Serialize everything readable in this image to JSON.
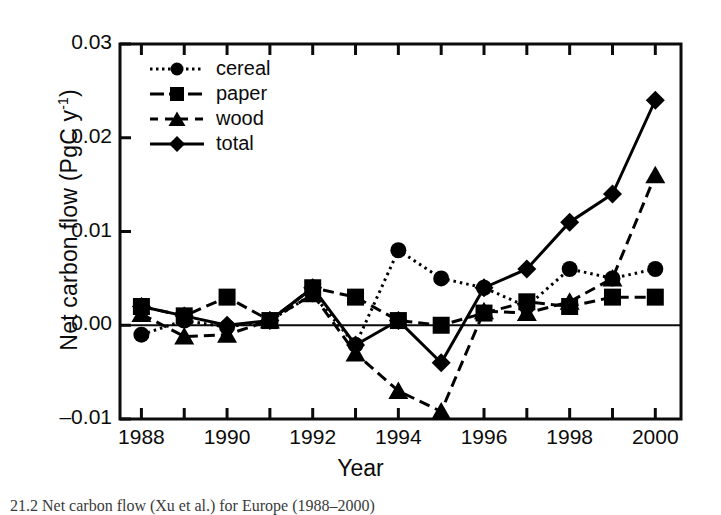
{
  "chart_data": {
    "type": "line",
    "title": "",
    "xlabel": "Year",
    "ylabel": "Net carbon flow (PgC y-1)",
    "ylabel_main": "Net carbon flow (PgC y",
    "ylabel_sup": "-1",
    "ylabel_tail": ")",
    "x": [
      1988,
      1989,
      1990,
      1991,
      1992,
      1993,
      1994,
      1995,
      1996,
      1997,
      1998,
      1999,
      2000
    ],
    "xlim": [
      1987.5,
      2000.6
    ],
    "ylim": [
      -0.01,
      0.03
    ],
    "grid": false,
    "legend_position": "upper-left-inside",
    "yticks": [
      -0.01,
      0.0,
      0.01,
      0.02,
      0.03
    ],
    "ytick_labels": [
      "–0.01",
      "0.00",
      "0.01",
      "0.02",
      "0.03"
    ],
    "xticks": [
      1988,
      1989,
      1990,
      1991,
      1992,
      1993,
      1994,
      1995,
      1996,
      1997,
      1998,
      1999,
      2000
    ],
    "xtick_labels_shown": [
      "1988",
      "1990",
      "1992",
      "1994",
      "1996",
      "1998",
      "2000"
    ],
    "xtick_labels_years": [
      1988,
      1990,
      1992,
      1994,
      1996,
      1998,
      2000
    ],
    "zero_line": 0.0,
    "series": [
      {
        "name": "cereal",
        "marker": "circle",
        "linestyle": "dotted",
        "color": "#000000",
        "values": [
          -0.001,
          0.0005,
          -0.0002,
          0.0005,
          0.0033,
          -0.0021,
          0.008,
          0.005,
          0.004,
          0.002,
          0.006,
          0.005,
          0.006
        ]
      },
      {
        "name": "paper",
        "marker": "square",
        "linestyle": "dashed",
        "color": "#000000",
        "values": [
          0.002,
          0.001,
          0.003,
          0.0005,
          0.004,
          0.003,
          0.0005,
          0.0,
          0.0013,
          0.0025,
          0.002,
          0.003,
          0.003
        ]
      },
      {
        "name": "wood",
        "marker": "triangle",
        "linestyle": "dashed",
        "color": "#000000",
        "values": [
          0.0012,
          -0.0012,
          -0.001,
          0.0005,
          0.0033,
          -0.003,
          -0.007,
          -0.0092,
          0.0015,
          0.0013,
          0.0025,
          0.005,
          0.016
        ]
      },
      {
        "name": "total",
        "marker": "diamond",
        "linestyle": "solid",
        "color": "#000000",
        "values": [
          0.002,
          0.001,
          0.0,
          0.0005,
          0.004,
          -0.0021,
          0.0005,
          -0.004,
          0.004,
          0.006,
          0.011,
          0.014,
          0.024
        ]
      }
    ]
  },
  "caption": {
    "text": "21.2  Net carbon flow (Xu et al.) for Europe (1988–2000)"
  }
}
